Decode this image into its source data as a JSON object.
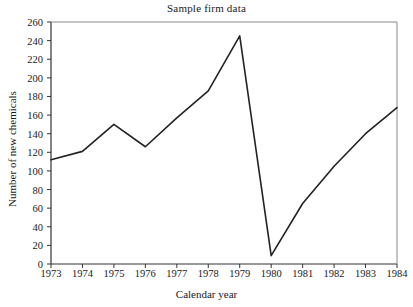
{
  "chart_data": {
    "type": "line",
    "title": "Sample firm data",
    "xlabel": "Calendar year",
    "ylabel": "Number of new chemicals",
    "x": [
      1973,
      1974,
      1975,
      1976,
      1977,
      1978,
      1979,
      1980,
      1981,
      1982,
      1983,
      1984
    ],
    "values": [
      112,
      121,
      150,
      126,
      157,
      186,
      245,
      9,
      65,
      105,
      140,
      168
    ],
    "xtick_labels": [
      "1973",
      "1974",
      "1975",
      "1976",
      "1977",
      "1978",
      "1979",
      "1980",
      "1981",
      "1982",
      "1983",
      "1984"
    ],
    "ytick_labels": [
      "0",
      "20",
      "40",
      "60",
      "80",
      "100",
      "120",
      "140",
      "160",
      "180",
      "200",
      "220",
      "240",
      "260"
    ],
    "yticks": [
      0,
      20,
      40,
      60,
      80,
      100,
      120,
      140,
      160,
      180,
      200,
      220,
      240,
      260
    ],
    "xlim": [
      1973,
      1984
    ],
    "ylim": [
      0,
      260
    ],
    "grid": false,
    "legend": null,
    "line_color": "#222222",
    "axis_color": "#333333",
    "background": "#ffffff"
  }
}
